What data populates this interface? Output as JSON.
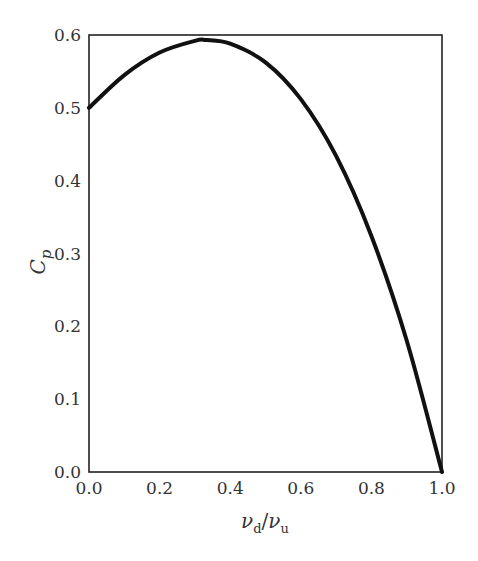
{
  "chart_data": {
    "type": "line",
    "title": "",
    "xlabel": "v_d/v_u",
    "ylabel": "C_p",
    "xlabel_parts": {
      "base1": "ν",
      "sub1": "d",
      "slash": "/",
      "base2": "ν",
      "sub2": "u"
    },
    "ylabel_parts": {
      "base": "C",
      "sub": "p"
    },
    "xlim": [
      0.0,
      1.0
    ],
    "ylim": [
      0.0,
      0.6
    ],
    "xticks": [
      "0.0",
      "0.2",
      "0.4",
      "0.6",
      "0.8",
      "1.0"
    ],
    "yticks": [
      "0.0",
      "0.1",
      "0.2",
      "0.3",
      "0.4",
      "0.5",
      "0.6"
    ],
    "grid": false,
    "legend": null,
    "series": [
      {
        "name": "Cp",
        "x": [
          0.0,
          0.1,
          0.2,
          0.3,
          0.333,
          0.4,
          0.5,
          0.6,
          0.7,
          0.8,
          0.9,
          1.0
        ],
        "y": [
          0.5,
          0.545,
          0.576,
          0.592,
          0.593,
          0.588,
          0.5625,
          0.512,
          0.434,
          0.324,
          0.1805,
          0.0
        ]
      }
    ]
  }
}
